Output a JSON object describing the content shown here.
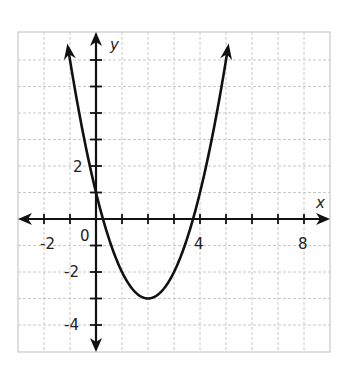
{
  "chart_data": {
    "type": "line",
    "title": "",
    "function": "y = x^2 - 4x + 1",
    "xlabel": "x",
    "ylabel": "y",
    "xlim": [
      -3,
      9
    ],
    "ylim": [
      -5,
      7
    ],
    "grid": true,
    "x_tick_labels": [
      "-2",
      "0",
      "4",
      "8"
    ],
    "y_tick_labels": [
      "2",
      "-2",
      "-4"
    ],
    "vertex": [
      2,
      -3
    ],
    "y_intercept": 1,
    "x_intercepts": [
      0.27,
      3.73
    ],
    "series": [
      {
        "name": "parabola",
        "x": [
          -1.16,
          -1,
          0,
          1,
          2,
          3,
          4,
          5,
          5.16
        ],
        "y": [
          7,
          6,
          1,
          -2,
          -3,
          -2,
          1,
          6,
          7
        ]
      }
    ]
  },
  "labels": {
    "x_axis": "x",
    "y_axis": "y",
    "origin": "0",
    "xm2": "-2",
    "x4": "4",
    "x8": "8",
    "y2": "2",
    "ym2": "-2",
    "ym4": "-4"
  }
}
